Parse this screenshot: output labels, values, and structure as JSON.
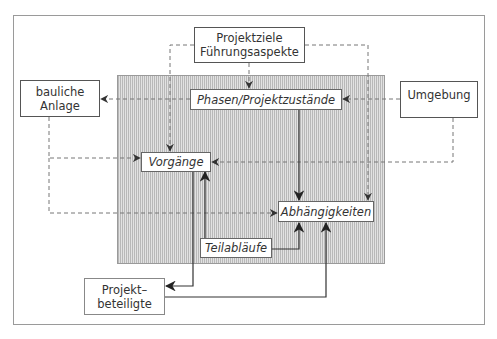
{
  "diagram": {
    "nodes": {
      "projektziele": {
        "line1": "Projektziele",
        "line2": "Führungsaspekte"
      },
      "phasen": {
        "label": "Phasen/Projektzustände"
      },
      "bauliche_anlage": {
        "line1": "bauliche",
        "line2": "Anlage"
      },
      "umgebung": {
        "label": "Umgebung"
      },
      "vorgaenge": {
        "label": "Vorgänge"
      },
      "abhaengigkeiten": {
        "label": "Abhängigkeiten"
      },
      "teilablaeufe": {
        "label": "Teilabläufe"
      },
      "projektbeteiligte": {
        "line1": "Projekt–",
        "line2": "beteiligte"
      }
    },
    "edges": [
      {
        "from": "Projektziele",
        "to": "Phasen/Projektzustände",
        "style": "dashed"
      },
      {
        "from": "Projektziele",
        "to": "Vorgänge",
        "style": "dashed"
      },
      {
        "from": "Projektziele",
        "to": "Abhängigkeiten",
        "style": "dashed"
      },
      {
        "from": "Phasen/Projektzustände",
        "to": "bauliche Anlage",
        "style": "dashed"
      },
      {
        "from": "Umgebung",
        "to": "Phasen/Projektzustände",
        "style": "dashed"
      },
      {
        "from": "Umgebung",
        "to": "Vorgänge",
        "style": "dashed"
      },
      {
        "from": "bauliche Anlage",
        "to": "Vorgänge",
        "style": "dashed"
      },
      {
        "from": "bauliche Anlage",
        "to": "Abhängigkeiten",
        "style": "dashed"
      },
      {
        "from": "Phasen/Projektzustände",
        "to": "Abhängigkeiten",
        "style": "solid"
      },
      {
        "from": "Teilabläufe",
        "to": "Vorgänge",
        "style": "solid"
      },
      {
        "from": "Teilabläufe",
        "to": "Abhängigkeiten",
        "style": "solid"
      },
      {
        "from": "Vorgänge",
        "to": "Projektbeteiligte",
        "style": "solid"
      },
      {
        "from": "Projektbeteiligte",
        "to": "Abhängigkeiten",
        "style": "solid"
      }
    ],
    "colors": {
      "line": "#333333",
      "dashed": "#777777",
      "shade": "#c8c8c8",
      "frame": "#9a9a9a"
    }
  }
}
